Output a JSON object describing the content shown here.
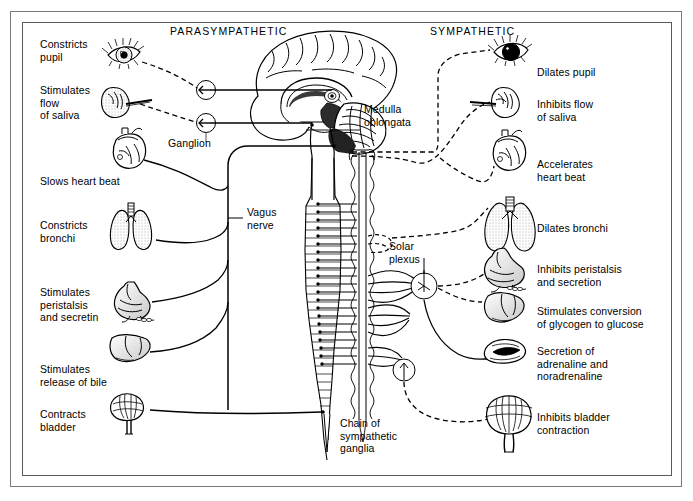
{
  "diagram": {
    "headings": {
      "parasympathetic": "PARASYMPATHETIC",
      "sympathetic": "SYMPATHETIC"
    },
    "central_labels": {
      "medulla_oblongata": "Medulla\noblongata",
      "ganglion": "Ganglion",
      "vagus_nerve": "Vagus\nnerve",
      "solar_plexus": "Solar\nplexus",
      "chain_of_sympathetic_ganglia": "Chain of\nsympathetic\nganglia"
    },
    "parasympathetic_effects": [
      {
        "label": "Constricts\npupil",
        "organ": "eye-constricted-pupil"
      },
      {
        "label": "Stimulates\nflow\nof saliva",
        "organ": "salivary-gland"
      },
      {
        "label": "Slows heart beat",
        "organ": "heart"
      },
      {
        "label": "Constricts\nbronchi",
        "organ": "lungs"
      },
      {
        "label": "Stimulates\nperistalsis\nand secretin",
        "organ": "stomach"
      },
      {
        "label": "Stimulates\nrelease of bile",
        "organ": "liver"
      },
      {
        "label": "Contracts\nbladder",
        "organ": "bladder"
      }
    ],
    "sympathetic_effects": [
      {
        "label": "Dilates pupil",
        "organ": "eye-dilated-pupil"
      },
      {
        "label": "Inhibits flow\nof saliva",
        "organ": "salivary-gland"
      },
      {
        "label": "Accelerates\nheart beat",
        "organ": "heart"
      },
      {
        "label": "Dilates bronchi",
        "organ": "lungs"
      },
      {
        "label": "Inhibits peristalsis\nand secretion",
        "organ": "stomach"
      },
      {
        "label": "Stimulates conversion\nof glycogen to glucose",
        "organ": "liver"
      },
      {
        "label": "Secretion of\nadrenaline and\nnoradrenaline",
        "organ": "adrenal-gland"
      },
      {
        "label": "Inhibits bladder\ncontraction",
        "organ": "bladder"
      }
    ],
    "colors": {
      "ink": "#000000",
      "paper": "#ffffff",
      "frame": "#7a7a7a",
      "shade": "#d8d8d8"
    }
  }
}
